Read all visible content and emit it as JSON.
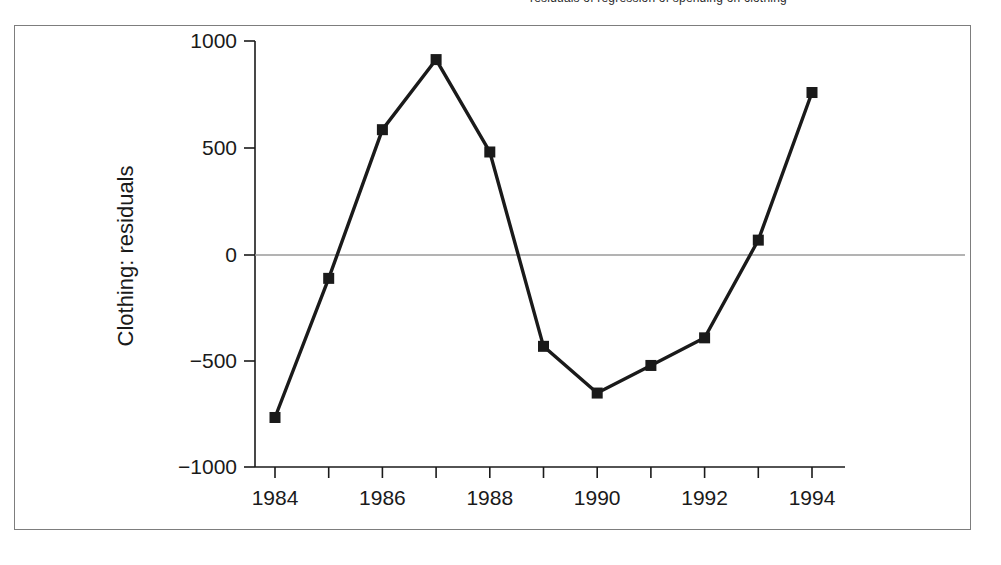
{
  "caption": {
    "sliver_text": "residuals of regression of spending on clothing"
  },
  "figure": {
    "frame_color": "#7d7d7d",
    "background_color": "#ffffff"
  },
  "chart_data": {
    "type": "line",
    "title": "",
    "subtitle": "",
    "xlabel": "",
    "ylabel": "Clothing: residuals",
    "x": [
      1984,
      1985,
      1986,
      1987,
      1988,
      1989,
      1990,
      1991,
      1992,
      1993,
      1994
    ],
    "values": [
      -765,
      -110,
      590,
      920,
      485,
      -430,
      -650,
      -520,
      -390,
      70,
      765
    ],
    "series": [
      {
        "name": "Clothing: residuals",
        "values": [
          -765,
          -110,
          590,
          920,
          485,
          -430,
          -650,
          -520,
          -390,
          70,
          765
        ]
      }
    ],
    "xlim": [
      1983.5,
      1994.6
    ],
    "ylim": [
      -1000,
      1000
    ],
    "xticks": [
      1984,
      1985,
      1986,
      1987,
      1988,
      1989,
      1990,
      1991,
      1992,
      1993,
      1994
    ],
    "xtick_labels": [
      "1984",
      "",
      "1986",
      "",
      "1988",
      "",
      "1990",
      "",
      "1992",
      "",
      "1994"
    ],
    "yticks": [
      -1000,
      -500,
      0,
      500,
      1000
    ],
    "ytick_labels": [
      "−1000",
      "−500",
      "0",
      "500",
      "1000"
    ],
    "grid": false,
    "zero_line": true,
    "zero_line_color": "#9a9a9a",
    "line_color": "#1a1a1a",
    "marker": "square",
    "marker_color": "#1a1a1a",
    "legend": false,
    "legend_position": "none"
  }
}
